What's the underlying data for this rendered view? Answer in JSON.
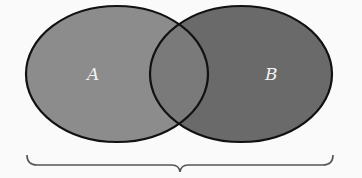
{
  "diagram": {
    "type": "venn",
    "sets": [
      {
        "id": "A",
        "label": "A",
        "fill": "#8c8c8c",
        "cx": 117,
        "cy": 74,
        "rx": 91,
        "ry": 68
      },
      {
        "id": "B",
        "label": "B",
        "fill": "#6a6a6a",
        "cx": 241,
        "cy": 74,
        "rx": 91,
        "ry": 68
      }
    ],
    "intersection_fill": "#7a7a7a",
    "outline_color": "#111111",
    "brace_color": "#555555",
    "background": "#fafafa"
  }
}
